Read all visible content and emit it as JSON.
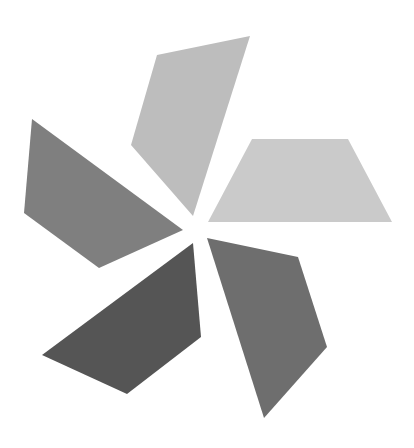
{
  "figure": {
    "background": "#ffffff",
    "blades": [
      {
        "name": "top",
        "color": "#bdbdbd",
        "points": "157,55 250,36 193,216 131,145"
      },
      {
        "name": "right",
        "color": "#cacaca",
        "points": "252,139 348,139 392,222 208,222"
      },
      {
        "name": "left",
        "color": "#7f7f7f",
        "points": "32,119 183,230 99,268 24,213"
      },
      {
        "name": "bottom-left",
        "color": "#555555",
        "points": "193,243 201,337 127,394 42,355"
      },
      {
        "name": "bottom-right",
        "color": "#6e6e6e",
        "points": "207,238 298,257 327,347 264,418"
      }
    ]
  }
}
